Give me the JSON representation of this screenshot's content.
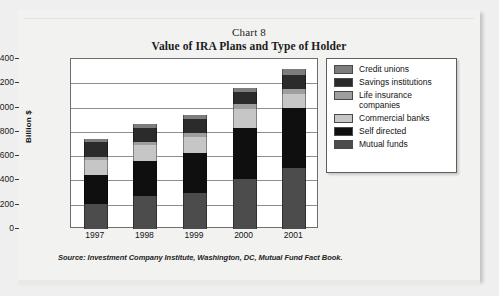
{
  "chart_card": {
    "title_line1": "Chart 8",
    "title_line2": "Value of IRA Plans and Type of Holder",
    "source_note": "Source: Investment Company Institute, Washington, DC, Mutual Fund Fact Book."
  },
  "axis": {
    "y_title": "Billion $",
    "y_ticks": [
      "0",
      "200",
      "400",
      "600",
      "800",
      "1000",
      "1200",
      "1400"
    ]
  },
  "legend": {
    "items": [
      {
        "label": "Credit unions",
        "color": "#7d7d7d"
      },
      {
        "label": "Savings institutions",
        "color": "#2b2b2b"
      },
      {
        "label": "Life insurance companies",
        "color": "#9e9e9e"
      },
      {
        "label": "Commercial banks",
        "color": "#c6c6c6"
      },
      {
        "label": "Self directed",
        "color": "#0f0f0f"
      },
      {
        "label": "Mutual funds",
        "color": "#4c4c4c"
      }
    ]
  },
  "chart_data": {
    "type": "bar",
    "stacked": true,
    "title": "Value of IRA Plans and Type of Holder",
    "subtitle": "Chart 8",
    "xlabel": "",
    "ylabel": "Billion $",
    "ylim": [
      0,
      1400
    ],
    "ytick_step": 200,
    "grid": true,
    "legend_position": "right",
    "categories": [
      "1997",
      "1998",
      "1999",
      "2000",
      "2001"
    ],
    "series": [
      {
        "name": "Mutual funds",
        "color": "#4c4c4c",
        "values": [
          210,
          270,
          300,
          410,
          505
        ]
      },
      {
        "name": "Self directed",
        "color": "#0f0f0f",
        "values": [
          235,
          290,
          325,
          420,
          495
        ]
      },
      {
        "name": "Commercial banks",
        "color": "#c6c6c6",
        "values": [
          125,
          130,
          135,
          160,
          110
        ]
      },
      {
        "name": "Life insurance companies",
        "color": "#9e9e9e",
        "values": [
          25,
          25,
          30,
          40,
          40
        ]
      },
      {
        "name": "Savings institutions",
        "color": "#2b2b2b",
        "values": [
          120,
          120,
          120,
          100,
          120
        ]
      },
      {
        "name": "Credit unions",
        "color": "#7d7d7d",
        "values": [
          30,
          30,
          30,
          35,
          45
        ]
      }
    ],
    "totals": [
      745,
      865,
      940,
      1165,
      1315
    ],
    "annotations": [
      "Source: Investment Company Institute, Washington, DC, Mutual Fund Fact Book."
    ]
  }
}
